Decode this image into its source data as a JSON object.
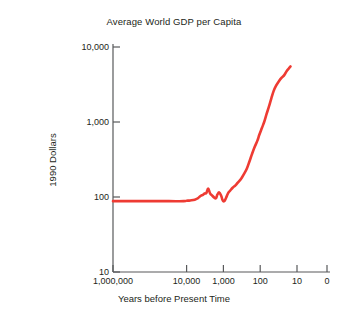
{
  "chart_data": {
    "type": "line",
    "title": "Average World GDP per Capita",
    "xlabel": "Years before Present Time",
    "ylabel": "1990 Dollars",
    "xscale": "log-reversed",
    "yscale": "log",
    "grid": false,
    "legend": "none",
    "xlim": [
      1000000,
      0
    ],
    "ylim": [
      10,
      10000
    ],
    "xticklabels": [
      "1,000,000",
      "10,000",
      "1,000",
      "100",
      "10",
      "0"
    ],
    "xtickvalues": [
      1000000,
      10000,
      1000,
      100,
      10,
      0
    ],
    "yticklabels": [
      "10,000",
      "1,000",
      "100",
      "10"
    ],
    "ytickvalues": [
      10000,
      1000,
      100,
      10
    ],
    "series": [
      {
        "name": "Average World GDP per Capita",
        "color": "#ee3b33",
        "linewidth": 2.6,
        "x": [
          1000000,
          300000,
          100000,
          30000,
          12000,
          10000,
          8000,
          6000,
          5000,
          4200,
          3600,
          3200,
          2900,
          2600,
          2300,
          2000,
          1800,
          1600,
          1450,
          1300,
          1150,
          1050,
          950,
          850,
          750,
          650,
          560,
          470,
          400,
          330,
          280,
          230,
          195,
          165,
          140,
          120,
          105,
          90,
          78,
          68,
          58,
          50,
          43,
          37,
          31,
          26,
          22,
          19,
          16,
          15
        ],
        "y": [
          88,
          88,
          88,
          88,
          88,
          89,
          90,
          92,
          96,
          103,
          107,
          112,
          113,
          130,
          112,
          104,
          99,
          96,
          108,
          115,
          104,
          91,
          88,
          97,
          112,
          122,
          133,
          143,
          157,
          175,
          200,
          240,
          300,
          380,
          470,
          560,
          680,
          830,
          1000,
          1250,
          1600,
          2050,
          2600,
          3050,
          3500,
          3900,
          4250,
          4800,
          5300,
          5500
        ]
      }
    ]
  }
}
